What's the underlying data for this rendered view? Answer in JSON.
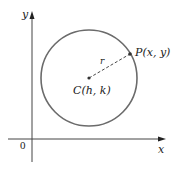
{
  "diagram": {
    "axes": {
      "x_label": "x",
      "y_label": "y",
      "origin_label": "0"
    },
    "circle": {
      "center_label": "C(h, k)",
      "point_label": "P(x, y)",
      "radius_label": "r"
    },
    "colors": {
      "circle_stroke": "#6b6b6b",
      "axis": "#333333",
      "text": "#222222"
    }
  }
}
